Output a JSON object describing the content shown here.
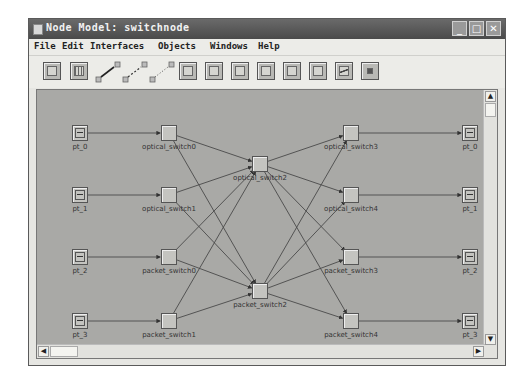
{
  "window": {
    "title": "Node Model: switchnode",
    "controls": [
      "minimize",
      "maximize",
      "close"
    ]
  },
  "menubar": {
    "items": [
      {
        "label": "File"
      },
      {
        "label": "Edit"
      },
      {
        "label": "Interfaces"
      },
      {
        "label": "Objects"
      },
      {
        "label": "Windows"
      },
      {
        "label": "Help"
      }
    ]
  },
  "toolbar": {
    "buttons": [
      {
        "icon": "create-processor-icon"
      },
      {
        "icon": "create-queue-icon"
      },
      {
        "icon": "create-packet-stream-icon"
      },
      {
        "icon": "create-statistic-wire-icon"
      },
      {
        "icon": "create-logical-association-icon"
      },
      {
        "icon": "create-transmitter-icon"
      },
      {
        "icon": "create-receiver-icon"
      },
      {
        "icon": "create-radio-transmitter-icon"
      },
      {
        "icon": "create-radio-receiver-icon"
      },
      {
        "icon": "create-bus-transmitter-icon"
      },
      {
        "icon": "create-bus-receiver-icon"
      },
      {
        "icon": "create-antenna-icon"
      },
      {
        "icon": "create-external-system-icon"
      }
    ]
  },
  "canvas": {
    "background": "#a9a9a6",
    "nodes": [
      {
        "id": "pt_0_in",
        "label": "pt_0",
        "type": "port",
        "x": 43,
        "y": 43
      },
      {
        "id": "pt_1_in",
        "label": "pt_1",
        "type": "port",
        "x": 43,
        "y": 105
      },
      {
        "id": "pt_2_in",
        "label": "pt_2",
        "type": "port",
        "x": 43,
        "y": 167
      },
      {
        "id": "pt_3_in",
        "label": "pt_3",
        "type": "port",
        "x": 43,
        "y": 231
      },
      {
        "id": "optical_switch0",
        "label": "optical_switch0",
        "type": "switch",
        "x": 132,
        "y": 43
      },
      {
        "id": "optical_switch1",
        "label": "optical_switch1",
        "type": "switch",
        "x": 132,
        "y": 105
      },
      {
        "id": "packet_switch0",
        "label": "packet_switch0",
        "type": "switch",
        "x": 132,
        "y": 167
      },
      {
        "id": "packet_switch1",
        "label": "packet_switch1",
        "type": "switch",
        "x": 132,
        "y": 231
      },
      {
        "id": "optical_switch2",
        "label": "optical_switch2",
        "type": "switch",
        "x": 223,
        "y": 74
      },
      {
        "id": "packet_switch2",
        "label": "packet_switch2",
        "type": "switch",
        "x": 223,
        "y": 201
      },
      {
        "id": "optical_switch3",
        "label": "optical_switch3",
        "type": "switch",
        "x": 314,
        "y": 43
      },
      {
        "id": "optical_switch4",
        "label": "optical_switch4",
        "type": "switch",
        "x": 314,
        "y": 105
      },
      {
        "id": "packet_switch3",
        "label": "packet_switch3",
        "type": "switch",
        "x": 314,
        "y": 167
      },
      {
        "id": "packet_switch4",
        "label": "packet_switch4",
        "type": "switch",
        "x": 314,
        "y": 231
      },
      {
        "id": "pt_0_out",
        "label": "pt_0",
        "type": "port",
        "x": 433,
        "y": 43
      },
      {
        "id": "pt_1_out",
        "label": "pt_1",
        "type": "port",
        "x": 433,
        "y": 105
      },
      {
        "id": "pt_2_out",
        "label": "pt_2",
        "type": "port",
        "x": 433,
        "y": 167
      },
      {
        "id": "pt_3_out",
        "label": "pt_3",
        "type": "port",
        "x": 433,
        "y": 231
      }
    ],
    "links": [
      [
        "pt_0_in",
        "optical_switch0"
      ],
      [
        "pt_1_in",
        "optical_switch1"
      ],
      [
        "pt_2_in",
        "packet_switch0"
      ],
      [
        "pt_3_in",
        "packet_switch1"
      ],
      [
        "optical_switch0",
        "optical_switch2"
      ],
      [
        "optical_switch0",
        "packet_switch2"
      ],
      [
        "optical_switch1",
        "optical_switch2"
      ],
      [
        "optical_switch1",
        "packet_switch2"
      ],
      [
        "packet_switch0",
        "optical_switch2"
      ],
      [
        "packet_switch0",
        "packet_switch2"
      ],
      [
        "packet_switch1",
        "optical_switch2"
      ],
      [
        "packet_switch1",
        "packet_switch2"
      ],
      [
        "optical_switch2",
        "optical_switch3"
      ],
      [
        "optical_switch2",
        "optical_switch4"
      ],
      [
        "optical_switch2",
        "packet_switch3"
      ],
      [
        "optical_switch2",
        "packet_switch4"
      ],
      [
        "packet_switch2",
        "optical_switch3"
      ],
      [
        "packet_switch2",
        "optical_switch4"
      ],
      [
        "packet_switch2",
        "packet_switch3"
      ],
      [
        "packet_switch2",
        "packet_switch4"
      ],
      [
        "optical_switch3",
        "pt_0_out"
      ],
      [
        "optical_switch4",
        "pt_1_out"
      ],
      [
        "packet_switch3",
        "pt_2_out"
      ],
      [
        "packet_switch4",
        "pt_3_out"
      ]
    ]
  },
  "scrollbars": {
    "vertical": {
      "up": "▲",
      "down": "▼"
    },
    "horizontal": {
      "left": "◀",
      "right": "▶"
    }
  }
}
